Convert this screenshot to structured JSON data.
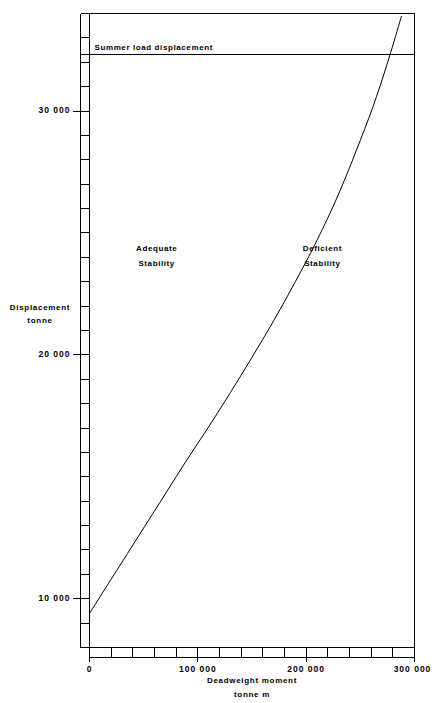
{
  "chart_data": {
    "type": "line",
    "title": "",
    "xlabel": "Deadweight moment",
    "xlabel_units": "tonne  m",
    "ylabel": "Displacement",
    "ylabel_units": "tonne",
    "xlim": [
      0,
      300000
    ],
    "ylim": [
      8000,
      34000
    ],
    "grid": false,
    "legend": "none",
    "x_ticks_major": [
      {
        "value": 0,
        "label": "0"
      },
      {
        "value": 100000,
        "label": "100 000"
      },
      {
        "value": 200000,
        "label": "200 000"
      },
      {
        "value": 300000,
        "label": "300 000"
      }
    ],
    "x_tick_minor_step": 20000,
    "y_ticks_major": [
      {
        "value": 10000,
        "label": "10 000"
      },
      {
        "value": 20000,
        "label": "20 000"
      },
      {
        "value": 30000,
        "label": "30 000"
      }
    ],
    "y_tick_minor_step": 1000,
    "series": [
      {
        "name": "Limiting KG / stability boundary curve",
        "x": [
          0,
          10000,
          20000,
          35000,
          50000,
          70000,
          90000,
          110000,
          130000,
          150000,
          170000,
          190000,
          210000,
          230000,
          250000,
          265000,
          278000,
          288000
        ],
        "y": [
          9400,
          10100,
          10800,
          11850,
          12900,
          14300,
          15700,
          17050,
          18450,
          19900,
          21400,
          23000,
          24700,
          26600,
          28800,
          30600,
          32400,
          33900
        ]
      }
    ],
    "reference_lines": [
      {
        "name": "summer-load-displacement",
        "orientation": "horizontal",
        "value": 32300,
        "label": "Summer load displacement"
      }
    ],
    "annotations": [
      {
        "name": "adequate-stability",
        "line1": "Adequate",
        "line2": "Stability",
        "x": 62000,
        "y": 24300
      },
      {
        "name": "deficient-stability",
        "line1": "Deficient",
        "line2": "Stability",
        "x": 215000,
        "y": 24300
      }
    ]
  }
}
